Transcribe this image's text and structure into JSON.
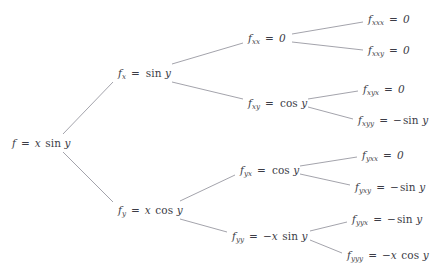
{
  "diagram": {
    "type": "derivative-tree",
    "title_fragment_clipped": "",
    "line_color": "#8c8c96",
    "text_color": "#3c3c46",
    "background": "#ffffff",
    "nodes": [
      {
        "id": "root",
        "level": 0,
        "label": "f = x sin y",
        "fn": "f",
        "sub": "",
        "rhs": "x sin y",
        "x": 12,
        "y": 143,
        "anchor": "left"
      },
      {
        "id": "fx",
        "level": 1,
        "label": "f_x = sin y",
        "fn": "f",
        "sub": "x",
        "rhs": "sin y",
        "x": 118,
        "y": 73,
        "anchor": "left"
      },
      {
        "id": "fy",
        "level": 1,
        "label": "f_y = x cos y",
        "fn": "f",
        "sub": "y",
        "rhs": "x cos y",
        "x": 118,
        "y": 210,
        "anchor": "left"
      },
      {
        "id": "fxx",
        "level": 2,
        "label": "f_xx = 0",
        "fn": "f",
        "sub": "xx",
        "rhs": "0",
        "x": 248,
        "y": 38,
        "anchor": "left"
      },
      {
        "id": "fxy",
        "level": 2,
        "label": "f_xy = cos y",
        "fn": "f",
        "sub": "xy",
        "rhs": "cos y",
        "x": 248,
        "y": 103,
        "anchor": "left"
      },
      {
        "id": "fyx",
        "level": 2,
        "label": "f_yx = cos y",
        "fn": "f",
        "sub": "yx",
        "rhs": "cos y",
        "x": 240,
        "y": 170,
        "anchor": "left"
      },
      {
        "id": "fyy",
        "level": 2,
        "label": "f_yy = -x sin y",
        "fn": "f",
        "sub": "yy",
        "rhs": "−x sin y",
        "x": 232,
        "y": 236,
        "anchor": "left"
      },
      {
        "id": "fxxx",
        "level": 3,
        "label": "f_xxx = 0",
        "fn": "f",
        "sub": "xxx",
        "rhs": "0",
        "x": 368,
        "y": 19,
        "anchor": "left"
      },
      {
        "id": "fxxy",
        "level": 3,
        "label": "f_xxy = 0",
        "fn": "f",
        "sub": "xxy",
        "rhs": "0",
        "x": 368,
        "y": 50,
        "anchor": "left"
      },
      {
        "id": "fxyx",
        "level": 3,
        "label": "f_xyx = 0",
        "fn": "f",
        "sub": "xyx",
        "rhs": "0",
        "x": 363,
        "y": 89,
        "anchor": "left"
      },
      {
        "id": "fxyy",
        "level": 3,
        "label": "f_xyy = -sin y",
        "fn": "f",
        "sub": "xyy",
        "rhs": "−sin y",
        "x": 358,
        "y": 120,
        "anchor": "left"
      },
      {
        "id": "fyxx",
        "level": 3,
        "label": "f_yxx = 0",
        "fn": "f",
        "sub": "yxx",
        "rhs": "0",
        "x": 362,
        "y": 155,
        "anchor": "left"
      },
      {
        "id": "fyxy",
        "level": 3,
        "label": "f_yxy = -sin y",
        "fn": "f",
        "sub": "yxy",
        "rhs": "−sin y",
        "x": 355,
        "y": 187,
        "anchor": "left"
      },
      {
        "id": "fyyx",
        "level": 3,
        "label": "f_yyx = -sin y",
        "fn": "f",
        "sub": "yyx",
        "rhs": "−sin y",
        "x": 352,
        "y": 219,
        "anchor": "left"
      },
      {
        "id": "fyyy",
        "level": 3,
        "label": "f_yyy = -x cos y",
        "fn": "f",
        "sub": "yyy",
        "rhs": "−x cos y",
        "x": 347,
        "y": 255,
        "anchor": "left"
      }
    ],
    "edges": [
      {
        "from": "root",
        "to": "fx",
        "x1": 63,
        "y1": 134,
        "x2": 113,
        "y2": 82
      },
      {
        "from": "root",
        "to": "fy",
        "x1": 63,
        "y1": 152,
        "x2": 113,
        "y2": 202
      },
      {
        "from": "fx",
        "to": "fxx",
        "x1": 172,
        "y1": 64,
        "x2": 243,
        "y2": 43
      },
      {
        "from": "fx",
        "to": "fxy",
        "x1": 172,
        "y1": 82,
        "x2": 243,
        "y2": 99
      },
      {
        "from": "fy",
        "to": "fyx",
        "x1": 180,
        "y1": 201,
        "x2": 235,
        "y2": 175
      },
      {
        "from": "fy",
        "to": "fyy",
        "x1": 180,
        "y1": 219,
        "x2": 227,
        "y2": 232
      },
      {
        "from": "fxx",
        "to": "fxxx",
        "x1": 292,
        "y1": 34,
        "x2": 363,
        "y2": 22
      },
      {
        "from": "fxx",
        "to": "fxxy",
        "x1": 292,
        "y1": 42,
        "x2": 363,
        "y2": 50
      },
      {
        "from": "fxy",
        "to": "fxyx",
        "x1": 308,
        "y1": 99,
        "x2": 358,
        "y2": 91
      },
      {
        "from": "fxy",
        "to": "fxyy",
        "x1": 308,
        "y1": 107,
        "x2": 353,
        "y2": 119
      },
      {
        "from": "fyx",
        "to": "fyxx",
        "x1": 300,
        "y1": 166,
        "x2": 357,
        "y2": 157
      },
      {
        "from": "fyx",
        "to": "fyxy",
        "x1": 300,
        "y1": 174,
        "x2": 350,
        "y2": 185
      },
      {
        "from": "fyy",
        "to": "fyyx",
        "x1": 310,
        "y1": 231,
        "x2": 347,
        "y2": 222
      },
      {
        "from": "fyy",
        "to": "fyyy",
        "x1": 310,
        "y1": 240,
        "x2": 342,
        "y2": 253
      }
    ]
  }
}
